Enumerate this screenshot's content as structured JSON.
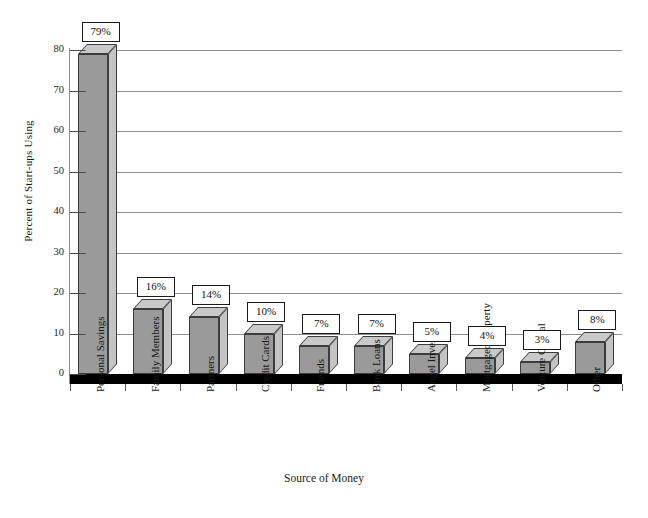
{
  "chart_data": {
    "type": "bar",
    "title": "",
    "xlabel": "Source of Money",
    "ylabel": "Percent of Start-ups Using",
    "ylim": [
      0,
      80
    ],
    "yticks": [
      0,
      10,
      20,
      30,
      40,
      50,
      60,
      70,
      80
    ],
    "grid": true,
    "legend_position": "none",
    "style": "3d-bar",
    "categories": [
      "Personal Savings",
      "Family Members",
      "Partners",
      "Credit Cards",
      "Friends",
      "Bank Loans",
      "Angel Investors",
      "Mortgaged Property",
      "Venture Capital",
      "Other"
    ],
    "values": [
      79,
      16,
      14,
      10,
      7,
      7,
      5,
      4,
      3,
      8
    ],
    "data_labels": [
      "79%",
      "16%",
      "14%",
      "10%",
      "7%",
      "7%",
      "5%",
      "4%",
      "3%",
      "8%"
    ]
  },
  "colors": {
    "bar_front": "#9a9a9a",
    "bar_top": "#c9c9c9",
    "bar_side": "#c4c4c4",
    "bar_outline": "#3c3c3c",
    "gridline": "#8d8d8d",
    "floor": "#000000",
    "background": "#ffffff",
    "text": "#111111"
  }
}
